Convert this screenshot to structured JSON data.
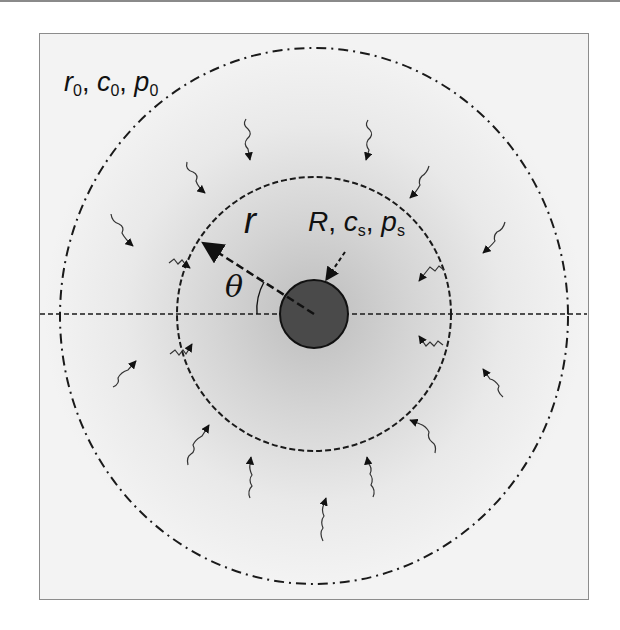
{
  "figure": {
    "type": "schematic",
    "labels": {
      "outer_boundary": {
        "r": "r",
        "r_sub": "0",
        "c": "c",
        "c_sub": "0",
        "p": "p",
        "p_sub": "0"
      },
      "radius": "r",
      "angle": "θ",
      "surface": {
        "R": "R",
        "c": "c",
        "c_sub": "s",
        "p": "p",
        "p_sub": "s"
      }
    },
    "elements": {
      "outer_circle": {
        "style": "dash-dot",
        "cx": 314,
        "cy": 316,
        "rx": 254,
        "ry": 268
      },
      "inner_circle": {
        "style": "dashed",
        "cx": 314,
        "cy": 314,
        "r": 137
      },
      "particle": {
        "cx": 314,
        "cy": 314,
        "r": 34,
        "fill": "#4a4a4a"
      },
      "axis_line": {
        "style": "dashed",
        "y": 314
      },
      "radius_arrow_angle_deg": 150,
      "flux_arrow_count": 19
    },
    "colors": {
      "line": "#1a1a1a",
      "particle_fill": "#4a4a4a",
      "gradient_inner": "#c4c4c4",
      "gradient_outer": "#f3f3f3",
      "frame_border": "#8c8c8c"
    }
  }
}
